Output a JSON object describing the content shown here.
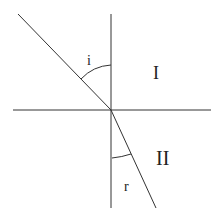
{
  "diagram": {
    "labels": {
      "incidence_angle": "i",
      "refraction_angle": "r",
      "medium_1": "I",
      "medium_2": "II"
    },
    "colors": {
      "line": "#333333",
      "background": "#ffffff"
    },
    "geometry": {
      "interface_y": 110,
      "normal_x": 111,
      "incident_ray": [
        [
          18,
          14
        ],
        [
          111,
          110
        ]
      ],
      "refracted_ray": [
        [
          111,
          110
        ],
        [
          156,
          208
        ]
      ]
    }
  }
}
